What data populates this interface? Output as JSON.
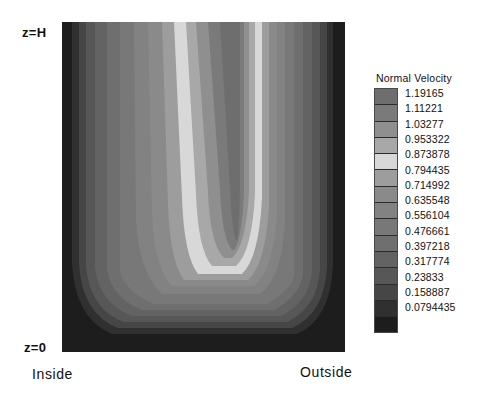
{
  "figure": {
    "axis": {
      "top_label": "z=H",
      "bottom_label": "z=0",
      "left_label": "Inside",
      "right_label": "Outside"
    },
    "legend": {
      "title": "Normal Velocity"
    }
  },
  "chart_data": {
    "type": "heatmap",
    "title": "",
    "subtitle": "",
    "xlabel": "",
    "ylabel": "",
    "annotations": [
      "z=H",
      "z=0",
      "Inside",
      "Outside"
    ],
    "legend_title": "Normal Velocity",
    "legend_position": "right",
    "grid": false,
    "colormap": "grayscale",
    "colorbar_levels": [
      {
        "value": "1.19165",
        "color": "#6e6e6e"
      },
      {
        "value": "1.11221",
        "color": "#7a7a7a"
      },
      {
        "value": "1.03277",
        "color": "#8f8f8f"
      },
      {
        "value": "0.953322",
        "color": "#a8a8a8"
      },
      {
        "value": "0.873878",
        "color": "#d8d8d8"
      },
      {
        "value": "0.794435",
        "color": "#9d9d9d"
      },
      {
        "value": "0.714992",
        "color": "#8a8a8a"
      },
      {
        "value": "0.635548",
        "color": "#828282"
      },
      {
        "value": "0.556104",
        "color": "#787878"
      },
      {
        "value": "0.476661",
        "color": "#6f6f6f"
      },
      {
        "value": "0.397218",
        "color": "#636363"
      },
      {
        "value": "0.317774",
        "color": "#575757"
      },
      {
        "value": "0.23833",
        "color": "#464646"
      },
      {
        "value": "0.158887",
        "color": "#303030"
      },
      {
        "value": "0.0794435",
        "color": "#1d1d1d"
      }
    ],
    "value_range": [
      0.0794435,
      1.19165
    ],
    "level_count": 15
  }
}
